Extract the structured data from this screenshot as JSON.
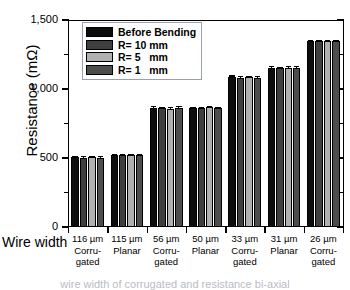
{
  "chart_data": {
    "type": "bar",
    "title": "",
    "xlabel": "Wire width",
    "ylabel": "Resistance (mΩ)",
    "ylim": [
      0,
      1500
    ],
    "yticks": [
      0,
      500,
      1000,
      1500
    ],
    "ytick_labels": [
      "0",
      "500",
      "1,000",
      "1,500"
    ],
    "yminor_ticks": [
      250,
      750,
      1250
    ],
    "grid": false,
    "legend_position": "top-left",
    "categories": [
      {
        "width": "116 µm",
        "type1": "Corru-",
        "type2": "gated"
      },
      {
        "width": "115 µm",
        "type1": "Planar",
        "type2": ""
      },
      {
        "width": "56 µm",
        "type1": "Corru-",
        "type2": "gated"
      },
      {
        "width": "50 µm",
        "type1": "Planar",
        "type2": ""
      },
      {
        "width": "33 µm",
        "type1": "Corru-",
        "type2": "gated"
      },
      {
        "width": "31 µm",
        "type1": "Planar",
        "type2": ""
      },
      {
        "width": "26 µm",
        "type1": "Corru-",
        "type2": "gated"
      }
    ],
    "category_labels": [
      "116 µm Corrugated",
      "115 µm Planar",
      "56 µm Corrugated",
      "50 µm Planar",
      "33 µm Corrugated",
      "31 µm Planar",
      "26 µm Corrugated"
    ],
    "series": [
      {
        "name": "Before Bending",
        "color": "#0d0d0d",
        "values": [
          505,
          520,
          860,
          862,
          1085,
          1155,
          1345
        ],
        "errors": [
          10,
          9,
          14,
          9,
          13,
          9,
          9
        ]
      },
      {
        "name": "R= 10 mm",
        "color": "#3f3f3f",
        "values": [
          503,
          522,
          860,
          864,
          1083,
          1153,
          1347
        ],
        "errors": [
          10,
          9,
          10,
          9,
          10,
          9,
          8
        ]
      },
      {
        "name": "R= 5   mm",
        "color": "#b0b0b0",
        "values": [
          508,
          522,
          858,
          866,
          1085,
          1155,
          1347
        ],
        "errors": [
          10,
          9,
          10,
          12,
          10,
          10,
          8
        ]
      },
      {
        "name": "R= 1   mm",
        "color": "#4d4d4d",
        "values": [
          502,
          520,
          862,
          864,
          1083,
          1155,
          1345
        ],
        "errors": [
          10,
          9,
          12,
          9,
          10,
          9,
          8
        ]
      }
    ]
  },
  "legend": {
    "items": [
      {
        "label": "Before Bending",
        "color": "#0d0d0d"
      },
      {
        "label": "R= 10 mm",
        "color": "#3f3f3f"
      },
      {
        "label": "R= 5   mm",
        "color": "#b0b0b0"
      },
      {
        "label": "R= 1   mm",
        "color": "#4d4d4d"
      }
    ]
  },
  "axes": {
    "ylabel": "Resistance (mΩ)",
    "xlabel": "Wire width",
    "ytick_labels": [
      "1,500",
      "1,000",
      "500",
      "0"
    ]
  },
  "caption": "wire width of corrugated and resistance bi-axial"
}
